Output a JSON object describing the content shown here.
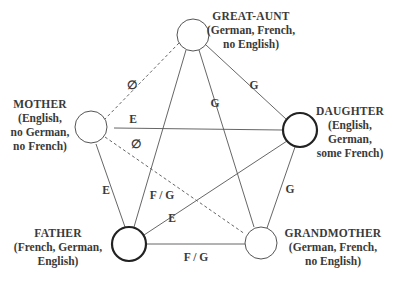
{
  "diagram": {
    "nodes": [
      {
        "id": "great_aunt",
        "name": "GREAT-AUNT",
        "languages": [
          "(German, French,",
          "no English)"
        ],
        "cx": 193,
        "cy": 35,
        "r": 16,
        "bold": false
      },
      {
        "id": "mother",
        "name": "MOTHER",
        "languages": [
          "(English,",
          "no German,",
          "no French)"
        ],
        "cx": 91,
        "cy": 127,
        "r": 16,
        "bold": false
      },
      {
        "id": "daughter",
        "name": "DAUGHTER",
        "languages": [
          "(English,",
          "German,",
          "some French)"
        ],
        "cx": 300,
        "cy": 130,
        "r": 17,
        "bold": true
      },
      {
        "id": "father",
        "name": "FATHER",
        "languages": [
          "(French, German,",
          "English)"
        ],
        "cx": 129,
        "cy": 244,
        "r": 17,
        "bold": true
      },
      {
        "id": "grandmother",
        "name": "GRANDMOTHER",
        "languages": [
          "(German, French,",
          "no English)"
        ],
        "cx": 261,
        "cy": 243,
        "r": 16,
        "bold": false
      }
    ],
    "edges": [
      {
        "from": "great_aunt",
        "to": "mother",
        "label": "∅",
        "style": "dashed",
        "lx": 132,
        "ly": 84
      },
      {
        "from": "great_aunt",
        "to": "daughter",
        "label": "G",
        "style": "solid",
        "lx": 254,
        "ly": 85
      },
      {
        "from": "great_aunt",
        "to": "father",
        "label": "F / G",
        "style": "solid",
        "lx": 160,
        "ly": 195
      },
      {
        "from": "great_aunt",
        "to": "grandmother",
        "label": "G",
        "style": "solid",
        "lx": 215,
        "ly": 103
      },
      {
        "from": "mother",
        "to": "daughter",
        "label": "E",
        "style": "solid",
        "lx": 133,
        "ly": 119
      },
      {
        "from": "mother",
        "to": "grandmother",
        "label": "∅",
        "style": "dashed",
        "lx": 136,
        "ly": 143
      },
      {
        "from": "mother",
        "to": "father",
        "label": "E",
        "style": "solid",
        "lx": 106,
        "ly": 189
      },
      {
        "from": "daughter",
        "to": "father",
        "label": "E",
        "style": "solid",
        "lx": 172,
        "ly": 218
      },
      {
        "from": "daughter",
        "to": "grandmother",
        "label": "G",
        "style": "solid",
        "lx": 290,
        "ly": 189
      },
      {
        "from": "father",
        "to": "grandmother",
        "label": "F / G",
        "style": "solid",
        "lx": 196,
        "ly": 256
      }
    ]
  },
  "labels": {
    "great_aunt": {
      "name": "GREAT-AUNT",
      "l1": "(German, French,",
      "l2": "no English)"
    },
    "mother": {
      "name": "MOTHER",
      "l1": "(English,",
      "l2": "no German,",
      "l3": "no French)"
    },
    "daughter": {
      "name": "DAUGHTER",
      "l1": "(English,",
      "l2": "German,",
      "l3": "some French)"
    },
    "father": {
      "name": "FATHER",
      "l1": "(French, German,",
      "l2": "English)"
    },
    "grandmother": {
      "name": "GRANDMOTHER",
      "l1": "(German, French,",
      "l2": "no English)"
    }
  },
  "edge_labels": {
    "ga_mother": "∅",
    "ga_daughter": "G",
    "ga_father": "F / G",
    "ga_grandmother": "G",
    "mother_daughter": "E",
    "mother_grandmother": "∅",
    "mother_father": "E",
    "daughter_father": "E",
    "daughter_grandmother": "G",
    "father_grandmother": "F / G"
  },
  "colors": {
    "line": "#555555",
    "text": "#3a3a3a",
    "node_stroke": "#555555",
    "node_stroke_bold": "#222222",
    "background": "#ffffff"
  }
}
